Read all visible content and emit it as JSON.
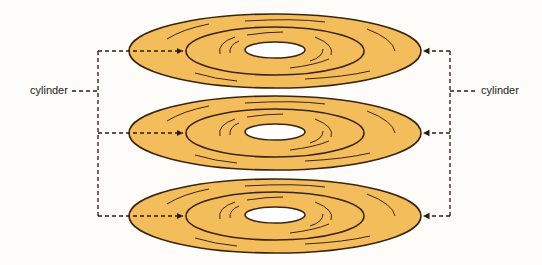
{
  "diagram": {
    "labels": {
      "left": "cylinder",
      "right": "cylinder"
    },
    "colors": {
      "platter_fill": "#f4bd5c",
      "platter_stroke": "#3a2410",
      "hole_fill": "#ffffff",
      "leader_line": "#2a1a10",
      "background": "#fdfcf8"
    },
    "platters": [
      {
        "name": "platter-top",
        "cy": 51
      },
      {
        "name": "platter-middle",
        "cy": 133
      },
      {
        "name": "platter-bottom",
        "cy": 216
      }
    ],
    "geometry": {
      "cx": 275,
      "outer_rx": 146,
      "outer_ry": 37,
      "inner_ring_rx": 89,
      "inner_ring_ry": 24,
      "hole_rx": 30,
      "hole_ry": 8,
      "left_bracket_x": 98,
      "right_bracket_x": 450,
      "left_label_y": 90,
      "right_label_y": 90
    }
  }
}
